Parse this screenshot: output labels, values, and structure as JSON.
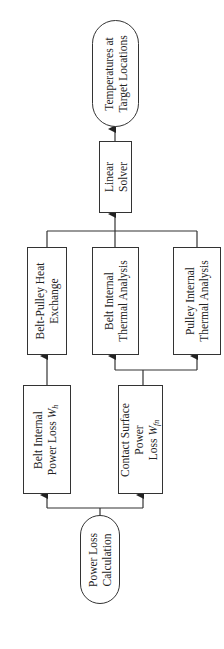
{
  "diagram": {
    "type": "flowchart",
    "orientation": "rotated -90deg (flow bottom to top)",
    "line_color": "#333333",
    "background": "#ffffff",
    "nodes": [
      {
        "id": "power-loss-calculation",
        "shape": "oval",
        "lines": [
          "Power Loss",
          "Calculation"
        ]
      },
      {
        "id": "belt-internal-power-loss",
        "shape": "rect",
        "lines": [
          "Belt Internal",
          "Power Loss W"
        ],
        "subscript": "h"
      },
      {
        "id": "contact-surface-power-loss",
        "shape": "rect",
        "lines": [
          "Contact Surface",
          "Power",
          "Loss W"
        ],
        "subscript": "fn"
      },
      {
        "id": "belt-pulley-heat-exchange",
        "shape": "rect",
        "lines": [
          "Belt-Pulley Heat",
          "Exchange"
        ]
      },
      {
        "id": "belt-internal-thermal-analysis",
        "shape": "rect",
        "lines": [
          "Belt Internal",
          "Thermal Analysis"
        ]
      },
      {
        "id": "pulley-internal-thermal-analysis",
        "shape": "rect",
        "lines": [
          "Pulley Internal",
          "Thermal Analysis"
        ]
      },
      {
        "id": "linear-solver",
        "shape": "rect",
        "lines": [
          "Linear",
          "Solver"
        ]
      },
      {
        "id": "temperatures-at-target-locations",
        "shape": "oval",
        "lines": [
          "Temperatures at",
          "Target Locations"
        ]
      }
    ],
    "edges": [
      {
        "from": "power-loss-calculation",
        "to": "belt-internal-power-loss"
      },
      {
        "from": "power-loss-calculation",
        "to": "contact-surface-power-loss"
      },
      {
        "from": "belt-internal-power-loss",
        "to": "belt-pulley-heat-exchange"
      },
      {
        "from": "contact-surface-power-loss",
        "to": "belt-internal-thermal-analysis"
      },
      {
        "from": "contact-surface-power-loss",
        "to": "pulley-internal-thermal-analysis"
      },
      {
        "from": "belt-pulley-heat-exchange",
        "to": "linear-solver"
      },
      {
        "from": "belt-internal-thermal-analysis",
        "to": "linear-solver"
      },
      {
        "from": "pulley-internal-thermal-analysis",
        "to": "linear-solver"
      },
      {
        "from": "linear-solver",
        "to": "temperatures-at-target-locations"
      }
    ]
  }
}
